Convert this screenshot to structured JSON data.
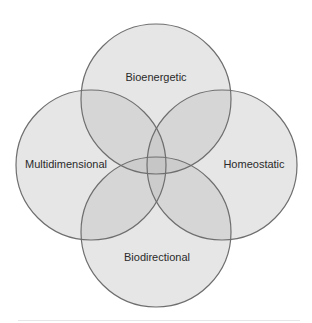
{
  "diagram": {
    "type": "venn",
    "circles": [
      {
        "id": "top",
        "label": "Bioenergetic",
        "cx": 156,
        "cy": 99,
        "r": 75
      },
      {
        "id": "left",
        "label": "Multidimensional",
        "cx": 91,
        "cy": 165,
        "r": 75
      },
      {
        "id": "right",
        "label": "Homeostatic",
        "cx": 222,
        "cy": 165,
        "r": 75
      },
      {
        "id": "bottom",
        "label": "Biodirectional",
        "cx": 156,
        "cy": 232,
        "r": 75
      }
    ],
    "colors": {
      "fill": "#bdbdbd",
      "fill_opacity": 0.38,
      "stroke": "#6e6e6e"
    }
  }
}
